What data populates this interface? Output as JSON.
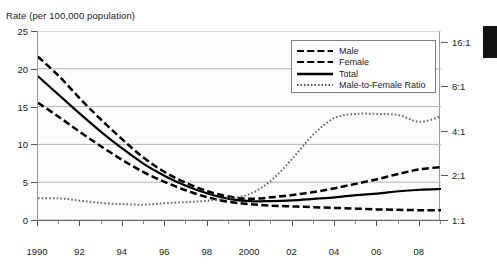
{
  "chart_data": {
    "type": "line",
    "title": "Rate (per 100,000 population)",
    "xlabel": "",
    "ylabel": "Rate (per 100,000 population)",
    "y2label": "Male-to-Female Ratio",
    "ylim": [
      0,
      25
    ],
    "y2lim": [
      "1:1",
      "16:1"
    ],
    "y2_scale": "log",
    "grid": true,
    "legend_position": "top-right",
    "x": [
      1990,
      1991,
      1992,
      1993,
      1994,
      1995,
      1996,
      1997,
      1998,
      1999,
      2000,
      2001,
      2002,
      2003,
      2004,
      2005,
      2006,
      2007,
      2008,
      2009
    ],
    "xticks": [
      1990,
      1992,
      1994,
      1996,
      1998,
      2000,
      2002,
      2004,
      2006,
      2008
    ],
    "xtick_labels": [
      "1990",
      "92",
      "94",
      "96",
      "98",
      "2000",
      "02",
      "04",
      "06",
      "08"
    ],
    "yticks": [
      0,
      5,
      10,
      15,
      20,
      25
    ],
    "ytick_labels": [
      "0",
      "5",
      "10",
      "15",
      "20",
      "25"
    ],
    "y2ticks": [
      1,
      2,
      4,
      8,
      16
    ],
    "y2tick_labels": [
      "1:1",
      "2:1",
      "4:1",
      "8:1",
      "16:1"
    ],
    "series": [
      {
        "name": "Male",
        "style": "dashed",
        "axis": "left",
        "values": [
          21.6,
          19.0,
          16.0,
          13.2,
          10.6,
          8.2,
          6.3,
          4.9,
          3.8,
          3.1,
          2.8,
          3.0,
          3.3,
          3.7,
          4.2,
          4.8,
          5.4,
          6.1,
          6.7,
          7.0
        ]
      },
      {
        "name": "Female",
        "style": "dashed",
        "axis": "left",
        "values": [
          15.5,
          13.6,
          11.6,
          9.7,
          7.9,
          6.3,
          5.0,
          3.9,
          3.0,
          2.4,
          2.1,
          1.9,
          1.8,
          1.7,
          1.6,
          1.5,
          1.4,
          1.35,
          1.3,
          1.3
        ]
      },
      {
        "name": "Total",
        "style": "solid",
        "axis": "left",
        "values": [
          19.0,
          16.5,
          14.0,
          11.6,
          9.4,
          7.4,
          5.8,
          4.5,
          3.5,
          2.8,
          2.5,
          2.5,
          2.6,
          2.8,
          3.0,
          3.3,
          3.5,
          3.8,
          4.0,
          4.1
        ]
      },
      {
        "name": "Male-to-Female Ratio",
        "style": "dotted",
        "axis": "right",
        "values": [
          1.4,
          1.4,
          1.35,
          1.3,
          1.28,
          1.27,
          1.3,
          1.32,
          1.35,
          1.4,
          1.5,
          1.85,
          2.6,
          3.8,
          4.9,
          5.2,
          5.2,
          5.1,
          4.6,
          5.0
        ]
      }
    ]
  },
  "legend": {
    "items": [
      {
        "label": "Male",
        "style": "dashed-long"
      },
      {
        "label": "Female",
        "style": "dashed-long"
      },
      {
        "label": "Total",
        "style": "solid"
      },
      {
        "label": "Male-to-Female Ratio",
        "style": "dotted"
      }
    ]
  },
  "colors": {
    "line": "#000000",
    "grid": "#b4b4b4",
    "axis": "#6f6f6f",
    "text": "#1c1c1c",
    "plot_bg": "#fbfbfb",
    "page_bg": "#ffffff",
    "edge_block": "#121212"
  }
}
